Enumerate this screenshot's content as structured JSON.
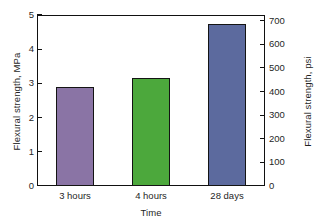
{
  "chart_data": {
    "type": "bar",
    "title": "",
    "xlabel": "Time",
    "ylabel": "Flexural strength, MPa",
    "ylabel_secondary": "Flexural strength, psi",
    "categories": [
      "3 hours",
      "4 hours",
      "28 days"
    ],
    "values": [
      2.9,
      3.15,
      4.73
    ],
    "values_secondary": [
      420,
      455,
      685
    ],
    "units": "MPa",
    "units_secondary": "psi",
    "ylim": [
      0,
      5
    ],
    "ylim_secondary": [
      0,
      725
    ],
    "yticks": [
      "0",
      "1",
      "2",
      "3",
      "4",
      "5"
    ],
    "yticks_secondary": [
      "0",
      "100",
      "200",
      "300",
      "400",
      "500",
      "600",
      "700"
    ],
    "grid": false,
    "legend": "none",
    "bar_colors": [
      "#8a74a5",
      "#4ca83c",
      "#5c6a9e"
    ],
    "bar_edge_color": "#141414",
    "axis_color": "#111111",
    "background": "#ffffff",
    "series": [
      {
        "name": "Flexural strength",
        "points": [
          {
            "category": "3 hours",
            "mpa": 2.9,
            "psi": 420,
            "color": "#8a74a5"
          },
          {
            "category": "4 hours",
            "mpa": 3.15,
            "psi": 455,
            "color": "#4ca83c"
          },
          {
            "category": "28 days",
            "mpa": 4.73,
            "psi": 685,
            "color": "#5c6a9e"
          }
        ]
      }
    ]
  }
}
